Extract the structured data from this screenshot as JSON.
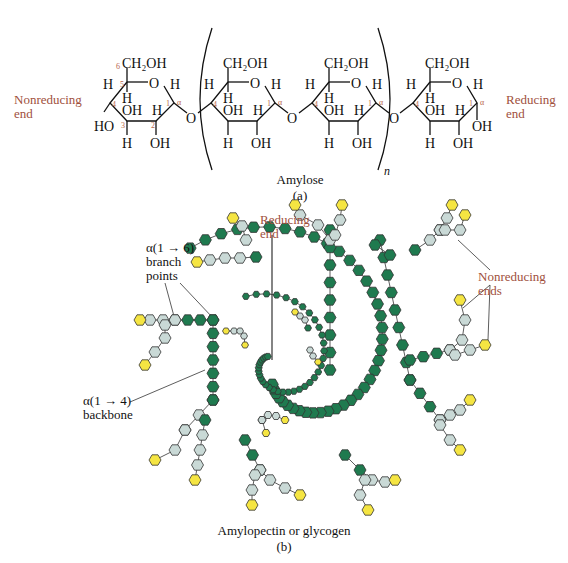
{
  "panel_a": {
    "left_label": [
      "Nonreducing",
      "end"
    ],
    "right_label": [
      "Reducing",
      "end"
    ],
    "title": "Amylose",
    "sub": "(a)",
    "repeat_subscript": "n",
    "groups": {
      "ch2oh": "CH₂OH",
      "oh": "OH",
      "ho": "HO",
      "h": "H",
      "o": "O"
    },
    "carbon_numbers": [
      "6",
      "5",
      "4",
      "3",
      "2",
      "1"
    ],
    "anomeric": "α"
  },
  "panel_b": {
    "title": "Amylopectin or glycogen",
    "sub": "(b)",
    "labels": {
      "reducing": [
        "Reducing",
        "end"
      ],
      "branch": [
        "α(1 → 6)",
        "branch",
        "points"
      ],
      "backbone": [
        "α(1 → 4)",
        "backbone"
      ],
      "nonreducing": [
        "Nonreducing",
        "ends"
      ]
    },
    "colors": {
      "backbone": "#1f7a4f",
      "branch": "#c9d9d6",
      "terminal": "#f5e542",
      "label_red": "#a0503c"
    }
  }
}
